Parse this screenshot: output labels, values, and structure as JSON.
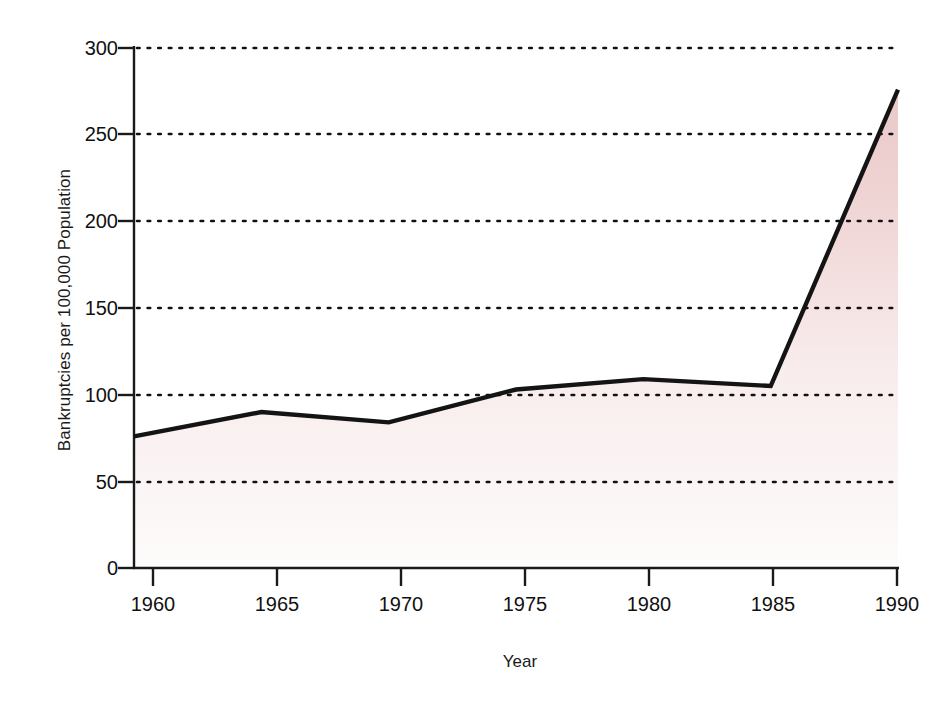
{
  "chart_data": {
    "type": "area",
    "title": "",
    "xlabel": "Year",
    "ylabel": "Bankruptcies per 100,000 Population",
    "x": [
      1960,
      1965,
      1970,
      1975,
      1980,
      1985,
      1990
    ],
    "values": [
      76,
      90,
      84,
      103,
      109,
      105,
      276
    ],
    "series": [
      {
        "name": "Bankruptcies per 100,000 Population",
        "values": [
          76,
          90,
          84,
          103,
          109,
          105,
          276
        ]
      }
    ],
    "xtick_labels": [
      "1960",
      "1965",
      "1970",
      "1975",
      "1980",
      "1985",
      "1990"
    ],
    "ytick_labels": [
      "0",
      "50",
      "100",
      "150",
      "200",
      "250",
      "300"
    ],
    "ytick_values": [
      0,
      50,
      100,
      150,
      200,
      250,
      300
    ],
    "xlim": [
      1960,
      1990
    ],
    "ylim": [
      0,
      300
    ],
    "grid": "horizontal-dotted",
    "legend": "none",
    "colors": {
      "line": "#141414",
      "fill_top": "#edcfd0",
      "fill_bottom": "#fcfafa",
      "grid": "#1a1a1a",
      "axis": "#1a1a1a",
      "background": "#ffffff"
    }
  },
  "axes": {
    "y_title": "Bankruptcies per 100,000 Population",
    "x_title": "Year"
  }
}
